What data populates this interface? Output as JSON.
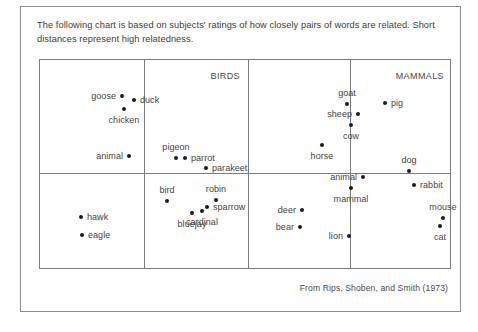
{
  "caption": "The following chart is based on subjects' ratings of how closely pairs of words are related. Short distances represent high relatedness.",
  "credit": "From Rips, Shoben, and Smith (1973)",
  "panel_labels": [
    {
      "text": "BIRDS",
      "x": 200,
      "y": 11
    },
    {
      "text": "MAMMALS",
      "x": 404,
      "y": 11
    }
  ],
  "chart_data": {
    "type": "scatter",
    "title": "",
    "subtitle": "",
    "xlabel": "",
    "ylabel": "",
    "grid": false,
    "axes_visible": false,
    "legend": "none",
    "note": "Multidimensional scaling solution; axes unlabeled, distance encodes semantic relatedness. Coordinates are plot-relative pixels within the 412x210 framed region.",
    "dividers": {
      "vertical_x": [
        104,
        208,
        310
      ],
      "horizontal_y": [
        113
      ]
    },
    "groups": [
      "BIRDS",
      "MAMMALS"
    ],
    "points": [
      {
        "label": "goose",
        "x": 82,
        "y": 36,
        "anchor": "left"
      },
      {
        "label": "duck",
        "x": 94,
        "y": 40,
        "anchor": "right"
      },
      {
        "label": "chicken",
        "x": 84,
        "y": 49,
        "anchor": "below"
      },
      {
        "label": "animal",
        "x": 89,
        "y": 96,
        "anchor": "left"
      },
      {
        "label": "hawk",
        "x": 41,
        "y": 157,
        "anchor": "right"
      },
      {
        "label": "eagle",
        "x": 42,
        "y": 175,
        "anchor": "right"
      },
      {
        "label": "pigeon",
        "x": 136,
        "y": 98,
        "anchor": "above"
      },
      {
        "label": "parrot",
        "x": 145,
        "y": 98,
        "anchor": "right"
      },
      {
        "label": "parakeet",
        "x": 166,
        "y": 108,
        "anchor": "right"
      },
      {
        "label": "bird",
        "x": 127,
        "y": 141,
        "anchor": "above"
      },
      {
        "label": "robin",
        "x": 176,
        "y": 140,
        "anchor": "above"
      },
      {
        "label": "sparrow",
        "x": 167,
        "y": 147,
        "anchor": "right"
      },
      {
        "label": "bluejay",
        "x": 152,
        "y": 153,
        "anchor": "below"
      },
      {
        "label": "cardinal",
        "x": 162,
        "y": 151,
        "anchor": "below"
      },
      {
        "label": "goat",
        "x": 307,
        "y": 44,
        "anchor": "above"
      },
      {
        "label": "sheep",
        "x": 318,
        "y": 54,
        "anchor": "left"
      },
      {
        "label": "cow",
        "x": 311,
        "y": 65,
        "anchor": "below"
      },
      {
        "label": "horse",
        "x": 282,
        "y": 85,
        "anchor": "below"
      },
      {
        "label": "animal",
        "x": 323,
        "y": 117,
        "anchor": "left"
      },
      {
        "label": "mammal",
        "x": 311,
        "y": 128,
        "anchor": "below"
      },
      {
        "label": "deer",
        "x": 262,
        "y": 150,
        "anchor": "left"
      },
      {
        "label": "bear",
        "x": 260,
        "y": 167,
        "anchor": "left"
      },
      {
        "label": "lion",
        "x": 309,
        "y": 176,
        "anchor": "left"
      },
      {
        "label": "pig",
        "x": 345,
        "y": 43,
        "anchor": "right"
      },
      {
        "label": "dog",
        "x": 369,
        "y": 111,
        "anchor": "above"
      },
      {
        "label": "rabbit",
        "x": 374,
        "y": 125,
        "anchor": "right"
      },
      {
        "label": "mouse",
        "x": 403,
        "y": 158,
        "anchor": "above"
      },
      {
        "label": "cat",
        "x": 400,
        "y": 166,
        "anchor": "below"
      }
    ]
  }
}
